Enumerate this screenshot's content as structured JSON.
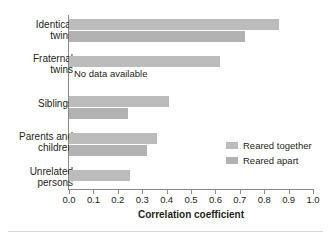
{
  "chart_data": {
    "type": "bar",
    "orientation": "horizontal",
    "title": "",
    "xlabel": "Correlation coefficient",
    "ylabel": "",
    "xlim": [
      0.0,
      1.0
    ],
    "xticks": [
      "0.0",
      "0.1",
      "0.2",
      "0.3",
      "0.4",
      "0.5",
      "0.6",
      "0.7",
      "0.8",
      "0.9",
      "1.0"
    ],
    "xtick_values": [
      0.0,
      0.1,
      0.2,
      0.3,
      0.4,
      0.5,
      0.6,
      0.7,
      0.8,
      0.9,
      1.0
    ],
    "grid": false,
    "legend_position": "middle-right",
    "categories": [
      "Identical twins",
      "Fraternal twins",
      "Siblings",
      "Parents and children",
      "Unrelated persons"
    ],
    "series": [
      {
        "name": "Reared together",
        "color": "#bcbcbc",
        "values": [
          0.86,
          0.62,
          0.41,
          0.36,
          0.25
        ]
      },
      {
        "name": "Reared apart",
        "color": "#b2b2b2",
        "values": [
          0.72,
          null,
          0.24,
          0.32,
          null
        ]
      }
    ],
    "annotations": [
      {
        "text": "No data available",
        "category": "Fraternal twins",
        "series": "Reared apart"
      }
    ]
  },
  "axis": {
    "x_title": "Correlation coefficient",
    "ticks": [
      {
        "label": "0.0",
        "value": 0.0
      },
      {
        "label": "0.1",
        "value": 0.1
      },
      {
        "label": "0.2",
        "value": 0.2
      },
      {
        "label": "0.3",
        "value": 0.3
      },
      {
        "label": "0.4",
        "value": 0.4
      },
      {
        "label": "0.5",
        "value": 0.5
      },
      {
        "label": "0.6",
        "value": 0.6
      },
      {
        "label": "0.7",
        "value": 0.7
      },
      {
        "label": "0.8",
        "value": 0.8
      },
      {
        "label": "0.9",
        "value": 0.9
      },
      {
        "label": "1.0",
        "value": 1.0
      }
    ]
  },
  "categories": [
    {
      "line1": "Identical",
      "line2": "twins"
    },
    {
      "line1": "Fraternal",
      "line2": "twins"
    },
    {
      "line1": "Siblings",
      "line2": ""
    },
    {
      "line1": "Parents and",
      "line2": "children"
    },
    {
      "line1": "Unrelated",
      "line2": "persons"
    }
  ],
  "annotation": {
    "no_data": "No data available"
  },
  "legend": {
    "items": [
      {
        "label": "Reared together",
        "color": "#bcbcbc"
      },
      {
        "label": "Reared apart",
        "color": "#b2b2b2"
      }
    ]
  }
}
